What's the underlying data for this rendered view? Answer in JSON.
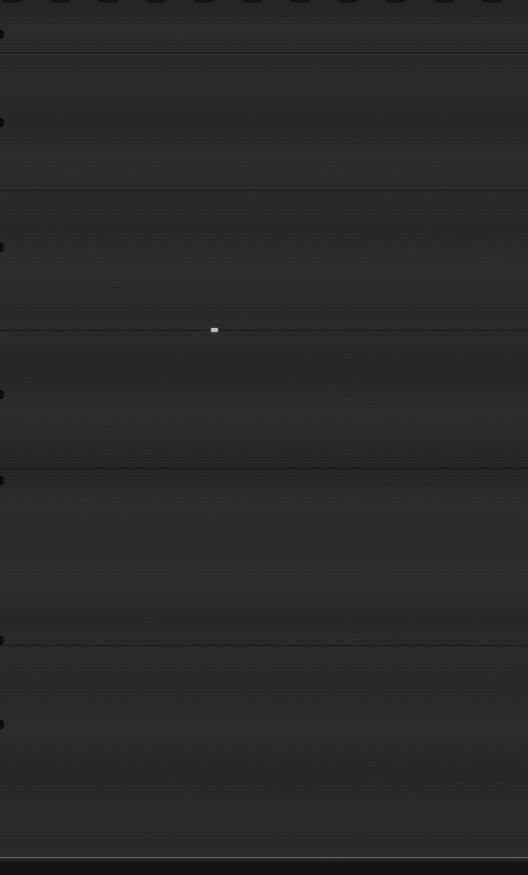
{
  "screen": {
    "width": 528,
    "height": 875,
    "state_label": "",
    "background_color": "#272727",
    "description": "Near-black blank display with faint horizontal banding"
  },
  "colors": {
    "background": "#272727",
    "band_light": "#2c2c2c",
    "band_dark": "#232323",
    "divider": "#1a1a1a",
    "bottom_rule": "#c8c8c8",
    "bottom_strip": "#131313",
    "edge_notch": "#0d0d0d",
    "cursor_mark": "#e1e1e1"
  },
  "dividers": [
    {
      "name": "divider-1",
      "y": 52
    },
    {
      "name": "divider-2",
      "y": 190
    },
    {
      "name": "divider-3",
      "y": 330
    },
    {
      "name": "divider-4",
      "y": 468
    },
    {
      "name": "divider-5",
      "y": 645
    }
  ],
  "edge_notches": [
    {
      "y": 30
    },
    {
      "y": 118
    },
    {
      "y": 243
    },
    {
      "y": 390
    },
    {
      "y": 476
    },
    {
      "y": 636
    },
    {
      "y": 720
    }
  ],
  "cursor": {
    "name": "cursor-mark",
    "x": 211,
    "y": 328,
    "label": ""
  },
  "bottom_rule": {
    "y": 857,
    "label": ""
  },
  "bottom_strip": {
    "y": 862,
    "height": 13,
    "label": ""
  },
  "overlay_text": {
    "empty": ""
  }
}
